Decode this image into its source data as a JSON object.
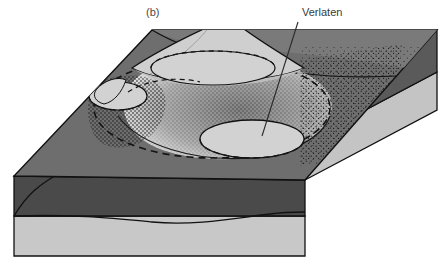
{
  "figure": {
    "panel_label": "(b)",
    "width": 446,
    "height": 265
  },
  "annotations": [
    {
      "name": "verlaten",
      "text": "Verlaten",
      "label_x": 302,
      "label_y": 6,
      "leader_from_x": 298,
      "leader_from_y": 22,
      "leader_to_x": 262,
      "leader_to_y": 136
    }
  ],
  "colors": {
    "background": "#ffffff",
    "top_surface": "#6e6e6e",
    "top_surface_far": "#7a7a7a",
    "crater_fill": "#d2d2d2",
    "cone_fill": "#cfcfcf",
    "cone_shadow": "#bdbdbd",
    "front_upper_band": "#6e6e6e",
    "front_dark_band": "#4a4a4a",
    "front_lower_band": "#c8c8c8",
    "side_dark_band": "#5a5a5a",
    "side_lower_band": "#c4c4c4",
    "stipple": "#1f1f1f",
    "outline": "#111111",
    "dashed_rim": "#151515",
    "label_text": "#3a3a3a"
  },
  "geometry": {
    "block": {
      "top_back_left": [
        152,
        30
      ],
      "top_back_right": [
        437,
        30
      ],
      "top_front_right": [
        305,
        180
      ],
      "top_front_left": [
        14,
        176
      ],
      "front_bottom_left": [
        14,
        256
      ],
      "front_bottom_right": [
        305,
        256
      ],
      "side_bottom_right": [
        437,
        110
      ]
    },
    "layers": {
      "front_dark_band_top_y": 176,
      "front_dark_band_bottom_y": 216,
      "front_base_y": 256,
      "side_band_split_y": 72
    }
  },
  "features": [
    {
      "name": "caldera-outer-rim",
      "type": "dashed-ellipse",
      "cx": 212,
      "cy": 108,
      "rx": 118,
      "ry": 50
    },
    {
      "name": "summit-crater",
      "type": "crater",
      "cx": 212,
      "cy": 68,
      "rx": 62,
      "ry": 18
    },
    {
      "name": "south-crater",
      "type": "crater",
      "cx": 252,
      "cy": 139,
      "rx": 52,
      "ry": 19
    },
    {
      "name": "west-crater",
      "type": "crater",
      "cx": 118,
      "cy": 96,
      "rx": 30,
      "ry": 14
    },
    {
      "name": "volcanic-cone",
      "type": "cone",
      "apex_x": 226,
      "apex_y": 24
    },
    {
      "name": "ash-stipple-field",
      "type": "stipple"
    }
  ]
}
